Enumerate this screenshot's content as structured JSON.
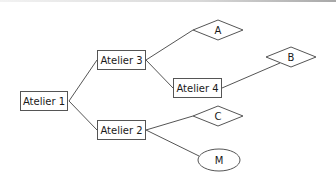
{
  "diagram": {
    "type": "tree",
    "nodes": [
      {
        "id": "atelier1",
        "label": "Atelier 1",
        "shape": "rect"
      },
      {
        "id": "atelier3",
        "label": "Atelier 3",
        "shape": "rect"
      },
      {
        "id": "atelier2",
        "label": "Atelier 2",
        "shape": "rect"
      },
      {
        "id": "atelier4",
        "label": "Atelier 4",
        "shape": "rect"
      },
      {
        "id": "a",
        "label": "A",
        "shape": "diamond"
      },
      {
        "id": "b",
        "label": "B",
        "shape": "diamond"
      },
      {
        "id": "c",
        "label": "C",
        "shape": "diamond"
      },
      {
        "id": "m",
        "label": "M",
        "shape": "ellipse"
      }
    ],
    "edges": [
      {
        "from": "atelier1",
        "to": "atelier3"
      },
      {
        "from": "atelier1",
        "to": "atelier2"
      },
      {
        "from": "atelier3",
        "to": "a"
      },
      {
        "from": "atelier3",
        "to": "atelier4"
      },
      {
        "from": "atelier4",
        "to": "b"
      },
      {
        "from": "atelier2",
        "to": "c"
      },
      {
        "from": "atelier2",
        "to": "m"
      }
    ]
  },
  "colors": {
    "stroke": "#555555",
    "text": "#1a1a1a",
    "background": "#ffffff"
  }
}
